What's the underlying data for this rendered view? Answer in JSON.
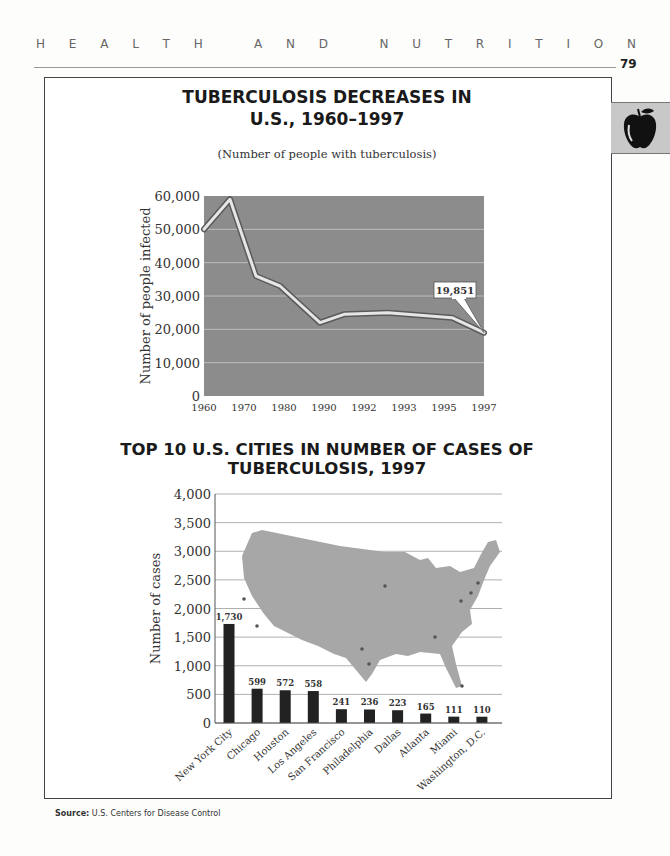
{
  "header": {
    "running_head_letters": [
      "H",
      "E",
      "A",
      "L",
      "T",
      "H",
      " ",
      "A",
      "N",
      "D",
      " ",
      "N",
      "U",
      "T",
      "R",
      "I",
      "T",
      "I",
      "O",
      "N"
    ],
    "running_head": "HEALTH AND NUTRITION",
    "page_number": "79",
    "tab_icon": "apple-icon"
  },
  "chart_data": [
    {
      "type": "line",
      "title": "TUBERCULOSIS DECREASES IN U.S., 1960–1997",
      "title_line1": "TUBERCULOSIS DECREASES IN",
      "title_line2": "U.S., 1960–1997",
      "subtitle": "(Number of people with tuberculosis)",
      "xlabel": "",
      "ylabel": "Number of people infected",
      "x_tick_labels": [
        "1960",
        "1970",
        "1980",
        "1990",
        "1992",
        "1993",
        "1995",
        "1997"
      ],
      "y_tick_labels": [
        "0",
        "10,000",
        "20,000",
        "30,000",
        "40,000",
        "50,000",
        "60,000"
      ],
      "ylim": [
        0,
        60000
      ],
      "grid": true,
      "background": "#8c8c8c",
      "points": [
        {
          "x_pos": 0.0,
          "value": 50000
        },
        {
          "x_pos": 0.65,
          "value": 59000
        },
        {
          "x_pos": 1.3,
          "value": 36000
        },
        {
          "x_pos": 1.9,
          "value": 33000
        },
        {
          "x_pos": 2.9,
          "value": 22000
        },
        {
          "x_pos": 3.5,
          "value": 24500
        },
        {
          "x_pos": 4.6,
          "value": 25000
        },
        {
          "x_pos": 6.2,
          "value": 23500
        },
        {
          "x_pos": 7.0,
          "value": 19000
        }
      ],
      "annotation": {
        "label": "19,851",
        "x": "1997",
        "value": 19851
      }
    },
    {
      "type": "bar",
      "title": "TOP 10 U.S. CITIES IN NUMBER OF CASES OF TUBERCULOSIS, 1997",
      "xlabel": "",
      "ylabel": "Number of cases",
      "categories": [
        "New York City",
        "Chicago",
        "Houston",
        "Los Angeles",
        "San Francisco",
        "Philadelphia",
        "Dallas",
        "Atlanta",
        "Miami",
        "Washington, D.C."
      ],
      "values": [
        1730,
        599,
        572,
        558,
        241,
        236,
        223,
        165,
        111,
        110
      ],
      "value_labels": [
        "1,730",
        "599",
        "572",
        "558",
        "241",
        "236",
        "223",
        "165",
        "111",
        "110"
      ],
      "y_tick_labels": [
        "0",
        "500",
        "1,000",
        "1,500",
        "2,000",
        "2,500",
        "3,000",
        "3,500",
        "4,000"
      ],
      "ylim": [
        0,
        4000
      ],
      "grid": true,
      "bar_color": "#222222",
      "background_image": "map of the continental United States with city dots"
    }
  ],
  "footer": {
    "source_label": "Source:",
    "source_text": "U.S. Centers for Disease Control"
  }
}
